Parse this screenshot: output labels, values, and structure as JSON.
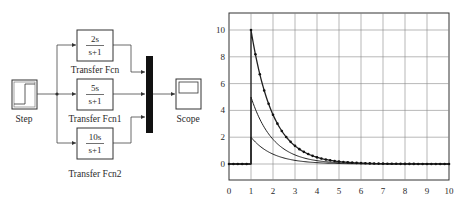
{
  "diagram": {
    "blocks": [
      {
        "id": "step",
        "label": "Step",
        "type": "source"
      },
      {
        "id": "tf1",
        "label": "Transfer Fcn",
        "numerator": "2s",
        "denominator": "s+1"
      },
      {
        "id": "tf2",
        "label": "Transfer Fcn1",
        "numerator": "5s",
        "denominator": "s+1"
      },
      {
        "id": "tf3",
        "label": "Transfer Fcn2",
        "numerator": "10s",
        "denominator": "s+1"
      },
      {
        "id": "mux",
        "label": "",
        "type": "mux"
      },
      {
        "id": "scope",
        "label": "Scope",
        "type": "sink"
      }
    ],
    "connections": [
      [
        "step",
        "tf1"
      ],
      [
        "step",
        "tf2"
      ],
      [
        "step",
        "tf3"
      ],
      [
        "tf1",
        "mux"
      ],
      [
        "tf2",
        "mux"
      ],
      [
        "tf3",
        "mux"
      ],
      [
        "mux",
        "scope"
      ]
    ]
  },
  "chart_data": {
    "type": "line",
    "title": "",
    "xlabel": "",
    "ylabel": "",
    "xlim": [
      0,
      10
    ],
    "ylim": [
      -1.2,
      11.2
    ],
    "grid": true,
    "x_ticks": [
      "0",
      "1",
      "2",
      "3",
      "4",
      "5",
      "6",
      "7",
      "8",
      "9",
      "10"
    ],
    "y_ticks": [
      "0",
      "2",
      "4",
      "6",
      "8",
      "10"
    ],
    "series": [
      {
        "name": "2s/(s+1)",
        "description": "0 for t<1, 2*exp(-(t-1)) for t>=1",
        "x": [
          0,
          1,
          1,
          2,
          3,
          4,
          5,
          6,
          7,
          8,
          9,
          10
        ],
        "values": [
          0,
          0,
          2.0,
          0.74,
          0.27,
          0.1,
          0.04,
          0.01,
          0.0,
          0.0,
          0.0,
          0.0
        ]
      },
      {
        "name": "5s/(s+1)",
        "description": "0 for t<1, 5*exp(-(t-1)) for t>=1",
        "x": [
          0,
          1,
          1,
          2,
          3,
          4,
          5,
          6,
          7,
          8,
          9,
          10
        ],
        "values": [
          0,
          0,
          5.0,
          1.84,
          0.68,
          0.25,
          0.09,
          0.03,
          0.01,
          0.0,
          0.0,
          0.0
        ]
      },
      {
        "name": "10s/(s+1)",
        "description": "0 for t<1, 10*exp(-(t-1)) for t>=1, dotted markers",
        "x": [
          0,
          1,
          1,
          2,
          3,
          4,
          5,
          6,
          7,
          8,
          9,
          10
        ],
        "values": [
          0,
          0,
          10.0,
          3.68,
          1.35,
          0.5,
          0.18,
          0.07,
          0.02,
          0.01,
          0.0,
          0.0
        ]
      }
    ]
  }
}
